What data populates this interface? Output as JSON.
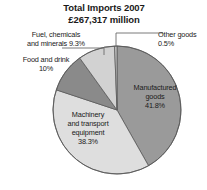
{
  "chart": {
    "title_line1": "Total Imports 2007",
    "title_line2": "£267,317 million"
  },
  "labels": {
    "fuel_line1": "Fuel, chemicals",
    "fuel_line2": "and minerals 9.3%",
    "food_line1": "Food and drink",
    "food_line2": "10%",
    "other_line1": "Other goods",
    "other_line2": "0.5%",
    "manufactured_line1": "Manufactured",
    "manufactured_line2": "goods",
    "manufactured_line3": "41.8%",
    "machinery_line1": "Machinery",
    "machinery_line2": "and transport",
    "machinery_line3": "equipment",
    "machinery_line4": "38.3%"
  },
  "chart_data": {
    "type": "pie",
    "title": "Total Imports 2007 £267,317 million",
    "total_label": "£267,317 million",
    "total_value": 267317,
    "units": "£ million",
    "xlabel": "",
    "ylabel": "",
    "legend": "none",
    "grid": false,
    "categories": [
      "Manufactured goods",
      "Machinery and transport equipment",
      "Food and drink",
      "Fuel, chemicals and minerals",
      "Other goods"
    ],
    "values": [
      41.8,
      38.3,
      10.0,
      9.3,
      0.5
    ],
    "value_labels": [
      "41.8%",
      "38.3%",
      "10%",
      "9.3%",
      "0.5%"
    ],
    "colors": [
      "#9a9a9a",
      "#dedede",
      "#8a8a8a",
      "#d2d2d2",
      "#c9c9c9"
    ],
    "slices": [
      {
        "name": "Manufactured goods",
        "percent": 41.8,
        "percent_label": "41.8%",
        "color": "#9a9a9a",
        "label_position": "inside",
        "start_deg": 0.0,
        "end_deg": 150.48
      },
      {
        "name": "Machinery and transport equipment",
        "percent": 38.3,
        "percent_label": "38.3%",
        "color": "#dedede",
        "label_position": "inside",
        "start_deg": 150.48,
        "end_deg": 288.36
      },
      {
        "name": "Food and drink",
        "percent": 10.0,
        "percent_label": "10%",
        "color": "#8a8a8a",
        "label_position": "outside-left",
        "start_deg": 288.36,
        "end_deg": 324.36
      },
      {
        "name": "Fuel, chemicals and minerals",
        "percent": 9.3,
        "percent_label": "9.3%",
        "color": "#d2d2d2",
        "label_position": "outside-top-left",
        "start_deg": 324.36,
        "end_deg": 357.84
      },
      {
        "name": "Other goods",
        "percent": 0.5,
        "percent_label": "0.5%",
        "color": "#c9c9c9",
        "label_position": "outside-top-right",
        "start_deg": 357.84,
        "end_deg": 360.0
      }
    ],
    "geometry": {
      "center_x": 117,
      "center_y": 110,
      "radius": 64,
      "start_angle_deg": 0,
      "direction": "clockwise"
    }
  },
  "colors": {
    "background": "#ffffff",
    "text": "#1a1a1a",
    "stroke": "#555555",
    "leader_line": "#6b6b6b"
  }
}
